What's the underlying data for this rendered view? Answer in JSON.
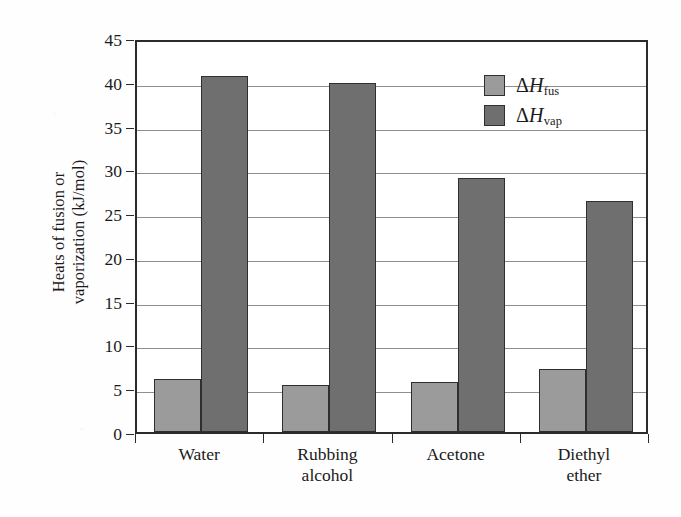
{
  "chart_data": {
    "type": "bar",
    "title": "",
    "xlabel": "",
    "ylabel": "Heats of fusion or\nvaporization (kJ/mol)",
    "categories": [
      "Water",
      "Rubbing\nalcohol",
      "Acetone",
      "Diethyl\nether"
    ],
    "series": [
      {
        "name": "ΔHfus",
        "label_delta": "Δ",
        "label_h": "H",
        "label_sub": "fus",
        "color": "#9b9b9b",
        "values": [
          6.0,
          5.4,
          5.7,
          7.2
        ]
      },
      {
        "name": "ΔHvap",
        "label_delta": "Δ",
        "label_h": "H",
        "label_sub": "vap",
        "color": "#6f6f6f",
        "values": [
          40.7,
          39.9,
          29.0,
          26.4
        ]
      }
    ],
    "ylim": [
      0,
      45
    ],
    "ytick_labels": [
      "45",
      "40",
      "35",
      "30",
      "25",
      "20",
      "15",
      "10",
      "5",
      "0"
    ],
    "ytick_values": [
      45,
      40,
      35,
      30,
      25,
      20,
      15,
      10,
      5,
      0
    ],
    "grid": true,
    "legend_position": "top-right",
    "axis_color": "#2b2b2b",
    "grid_color": "#8e8e8e",
    "background": "#ffffff"
  },
  "legend": {
    "entries": [
      {
        "delta": "Δ",
        "h": "H",
        "sub": "fus"
      },
      {
        "delta": "Δ",
        "h": "H",
        "sub": "vap"
      }
    ]
  },
  "axis": {
    "y_title_line1": "Heats of fusion or",
    "y_title_line2": "vaporization (kJ/mol)"
  }
}
